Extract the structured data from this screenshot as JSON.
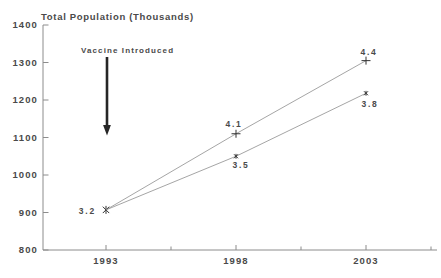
{
  "page": {
    "background": "#ffffff"
  },
  "chart": {
    "title": "Total Population (Thousands)",
    "annotation_text": "Vaccine Introduced"
  },
  "chart_data": {
    "type": "line",
    "title": "Total Population (Thousands)",
    "xlabel": "",
    "ylabel": "Total Population (Thousands)",
    "x": [
      1993,
      1998,
      2003
    ],
    "x_tick_labels": [
      "1993",
      "1998",
      "2003"
    ],
    "x_minor_ticks": [
      1995.5,
      2000.5,
      2005.5
    ],
    "y_ticks": [
      800,
      900,
      1000,
      1100,
      1200,
      1300,
      1400
    ],
    "ylim": [
      800,
      1400
    ],
    "xlim": [
      1990.6,
      2005.7
    ],
    "grid": false,
    "legend": false,
    "series": [
      {
        "name": "upper-line",
        "color": "#9b9b9b",
        "values": [
          907,
          1110,
          1305
        ],
        "markers": [
          "asterisk",
          "plus",
          "plus"
        ],
        "point_labels": [
          "3.2",
          "4.1",
          "4.4"
        ]
      },
      {
        "name": "lower-line",
        "color": "#9b9b9b",
        "values": [
          907,
          1050,
          1218
        ],
        "markers": [
          null,
          "asterisk-small",
          "asterisk-small"
        ],
        "point_labels": [
          null,
          "3.5",
          "3.8"
        ]
      }
    ],
    "annotation": {
      "text": "Vaccine Introduced",
      "arrow": "down",
      "x": 1993,
      "arrow_tip_value": 1107
    }
  },
  "colors": {
    "axis": "#8c8c8c",
    "line": "#9b9b9b",
    "marker": "#333333",
    "text": "#4a4a4a",
    "arrow": "#262626",
    "background": "#ffffff"
  }
}
